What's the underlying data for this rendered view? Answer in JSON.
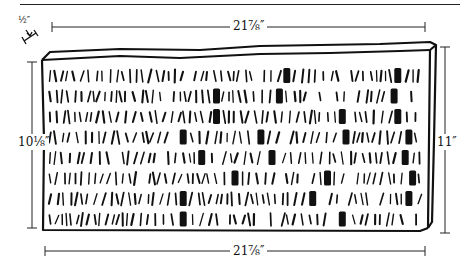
{
  "figure": {
    "colors": {
      "ink": "#111111",
      "background": "#ffffff"
    }
  },
  "dimensions": {
    "top_width": "21⅞″",
    "bottom_width": "21⅞″",
    "left_height": "10⅛″",
    "right_height": "11″",
    "thickness": "½″"
  },
  "tablet": {
    "rows": 8,
    "rows_data": [
      {
        "strokes_before": [
          18,
          0
        ],
        "markers": [
          0.64,
          0.94
        ]
      },
      {
        "strokes_before": [
          20
        ],
        "markers": [
          0.45,
          0.62,
          0.93
        ]
      },
      {
        "strokes_before": [
          22
        ],
        "markers": [
          0.45,
          0.79,
          0.94
        ]
      },
      {
        "strokes_before": [
          20
        ],
        "markers": [
          0.36,
          0.57,
          0.8,
          0.97
        ]
      },
      {
        "strokes_before": [
          18
        ],
        "markers": [
          0.41,
          0.6,
          0.96
        ]
      },
      {
        "strokes_before": [
          20
        ],
        "markers": [
          0.5,
          0.75,
          0.98
        ]
      },
      {
        "strokes_before": [
          20
        ],
        "markers": [
          0.36,
          0.71,
          0.97
        ]
      },
      {
        "strokes_before": [
          20
        ],
        "markers": [
          0.36,
          0.79
        ]
      }
    ]
  }
}
